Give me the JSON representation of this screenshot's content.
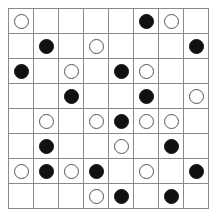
{
  "board": {
    "rows": 8,
    "cols": 8,
    "colors": {
      "grid_line": "#8a8a8a",
      "black_piece": "#111111",
      "white_piece_fill": "#ffffff",
      "white_piece_outline": "#555555"
    },
    "cells": [
      [
        "white",
        "",
        "",
        "",
        "",
        "black",
        "white",
        ""
      ],
      [
        "",
        "black",
        "",
        "white",
        "",
        "",
        "",
        "black"
      ],
      [
        "black",
        "",
        "white",
        "",
        "black",
        "white",
        "",
        ""
      ],
      [
        "",
        "",
        "black",
        "",
        "",
        "black",
        "",
        "white"
      ],
      [
        "",
        "white",
        "",
        "white",
        "black",
        "white",
        "white",
        ""
      ],
      [
        "",
        "black",
        "",
        "",
        "white",
        "",
        "black",
        ""
      ],
      [
        "white",
        "black",
        "white",
        "black",
        "",
        "white",
        "",
        "black"
      ],
      [
        "",
        "",
        "",
        "white",
        "black",
        "",
        "black",
        ""
      ]
    ]
  }
}
